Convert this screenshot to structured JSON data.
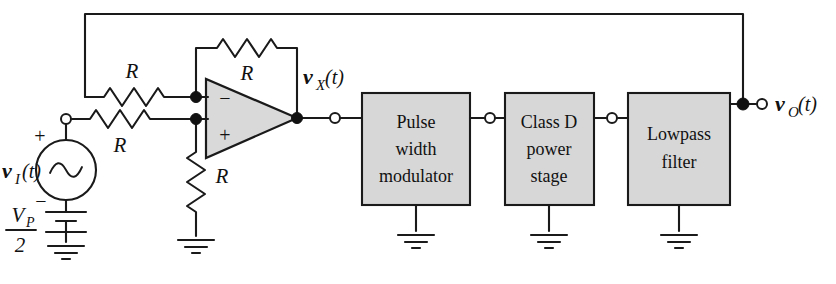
{
  "figure": {
    "type": "circuit-schematic",
    "caption_partial": "",
    "colors": {
      "wire": "#1a1a1a",
      "block_fill": "#d7d7d7",
      "opamp_fill": "#d9d9d9",
      "background": "#ffffff",
      "node": "#111111"
    }
  },
  "labels": {
    "resistor_feedback_outer": "R",
    "resistor_opamp_feedback": "R",
    "resistor_input": "R",
    "resistor_shunt": "R",
    "source_label": "v",
    "source_sub": "I",
    "source_paren": "(t)",
    "source_plus": "+",
    "source_minus": "−",
    "battery_numer": "V",
    "battery_numer_sub": "P",
    "battery_denom": "2",
    "node_vx": "v",
    "node_vx_sub": "X",
    "node_vx_paren": "(t)",
    "node_vo": "v",
    "node_vo_sub": "O",
    "node_vo_paren": "(t)",
    "opamp_inverting": "−",
    "opamp_noninverting": "+"
  },
  "blocks": [
    {
      "id": "pulse-width-modulator",
      "lines": [
        "Pulse",
        "width",
        "modulator"
      ]
    },
    {
      "id": "class-d-power-stage",
      "lines": [
        "Class D",
        "power",
        "stage"
      ]
    },
    {
      "id": "lowpass-filter",
      "lines": [
        "Lowpass",
        "filter"
      ]
    }
  ],
  "grounds": [
    {
      "id": "ground-source"
    },
    {
      "id": "ground-shunt-resistor"
    },
    {
      "id": "ground-pwm"
    },
    {
      "id": "ground-class-d"
    },
    {
      "id": "ground-lowpass"
    }
  ]
}
